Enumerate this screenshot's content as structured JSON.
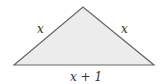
{
  "diagram": {
    "shape": "isosceles-triangle",
    "fill_color": "#ececec",
    "stroke_color": "#666666",
    "labels": {
      "left_side": "x",
      "right_side": "x",
      "base": "x + 1"
    }
  }
}
